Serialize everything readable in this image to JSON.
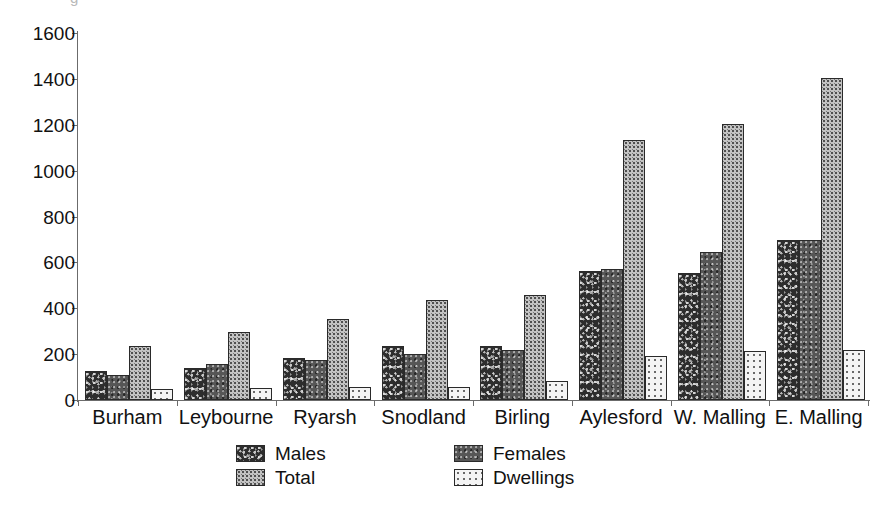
{
  "clipped_title_fragment": "g",
  "chart_data": {
    "type": "bar",
    "title": "",
    "subtitle": "",
    "xlabel": "",
    "ylabel": "",
    "ylim": [
      0,
      1600
    ],
    "ytick_step": 200,
    "yticks": [
      0,
      200,
      400,
      600,
      800,
      1000,
      1200,
      1400,
      1600
    ],
    "ytick_labels": [
      "0",
      "200",
      "400",
      "600",
      "800",
      "1000",
      "1200",
      "1400",
      "1600"
    ],
    "grid": false,
    "legend_position": "bottom",
    "categories": [
      "Burham",
      "Leybourne",
      "Ryarsh",
      "Snodland",
      "Birling",
      "Aylesford",
      "W. Malling",
      "E. Malling"
    ],
    "series": [
      {
        "name": "Males",
        "color": "#2d2d2d",
        "pattern": "dark-speckle",
        "values": [
          128,
          140,
          182,
          235,
          237,
          562,
          553,
          697
        ]
      },
      {
        "name": "Females",
        "color": "#565656",
        "pattern": "mid-dark-speckle",
        "values": [
          110,
          157,
          176,
          200,
          218,
          570,
          645,
          697
        ]
      },
      {
        "name": "Total",
        "color": "#c3c3c3",
        "pattern": "grey-dot-grid",
        "values": [
          236,
          297,
          354,
          436,
          458,
          1133,
          1203,
          1404
        ]
      },
      {
        "name": "Dwellings",
        "color": "#f4f4f4",
        "pattern": "light-dot-grid",
        "values": [
          46,
          52,
          58,
          57,
          82,
          192,
          213,
          218
        ]
      }
    ]
  }
}
